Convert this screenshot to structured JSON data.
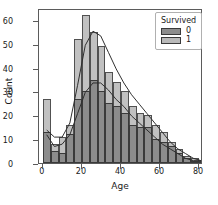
{
  "chart_data": {
    "type": "bar",
    "title": "",
    "xlabel": "Age",
    "ylabel": "Count",
    "xlim": [
      -2,
      82
    ],
    "ylim": [
      0,
      65
    ],
    "xticks": [
      0,
      20,
      40,
      60,
      80
    ],
    "yticks": [
      0,
      10,
      20,
      30,
      40,
      50,
      60
    ],
    "grid": false,
    "legend": {
      "title": "Survived",
      "position": "upper-right",
      "entries": [
        {
          "label": "0",
          "color": "#8c8c8c"
        },
        {
          "label": "1",
          "color": "#b9b9b9"
        }
      ]
    },
    "bin_width": 4,
    "bin_starts": [
      0,
      4,
      8,
      12,
      16,
      20,
      24,
      28,
      32,
      36,
      40,
      44,
      48,
      52,
      56,
      60,
      64,
      68,
      72,
      76,
      80
    ],
    "series": [
      {
        "name": "0",
        "color": "#8c8c8c",
        "values": [
          13,
          5,
          4,
          12,
          27,
          30,
          35,
          30,
          25,
          24,
          21,
          16,
          15,
          15,
          10,
          9,
          7,
          4,
          2,
          1,
          1
        ]
      },
      {
        "name": "1",
        "color": "#b9b9b9",
        "values": [
          27,
          8,
          11,
          16,
          52,
          62,
          55,
          49,
          38,
          34,
          30,
          24,
          21,
          20,
          16,
          13,
          9,
          6,
          3,
          2,
          1
        ]
      }
    ],
    "kde_curves": [
      {
        "name": "0",
        "points": [
          [
            0,
            12
          ],
          [
            4,
            7
          ],
          [
            8,
            8
          ],
          [
            12,
            12
          ],
          [
            16,
            21
          ],
          [
            20,
            30
          ],
          [
            24,
            34
          ],
          [
            28,
            34
          ],
          [
            32,
            31
          ],
          [
            36,
            27
          ],
          [
            40,
            24
          ],
          [
            44,
            20
          ],
          [
            48,
            17
          ],
          [
            52,
            14
          ],
          [
            56,
            11
          ],
          [
            60,
            8
          ],
          [
            64,
            6
          ],
          [
            68,
            4
          ],
          [
            72,
            2
          ],
          [
            76,
            1
          ],
          [
            80,
            1
          ]
        ]
      },
      {
        "name": "1",
        "points": [
          [
            0,
            14
          ],
          [
            4,
            11
          ],
          [
            8,
            11
          ],
          [
            12,
            17
          ],
          [
            16,
            33
          ],
          [
            20,
            50
          ],
          [
            24,
            56
          ],
          [
            28,
            54
          ],
          [
            32,
            47
          ],
          [
            36,
            40
          ],
          [
            40,
            34
          ],
          [
            44,
            29
          ],
          [
            48,
            25
          ],
          [
            52,
            21
          ],
          [
            56,
            17
          ],
          [
            60,
            13
          ],
          [
            64,
            9
          ],
          [
            68,
            6
          ],
          [
            72,
            4
          ],
          [
            76,
            2
          ],
          [
            80,
            1
          ]
        ]
      }
    ]
  }
}
